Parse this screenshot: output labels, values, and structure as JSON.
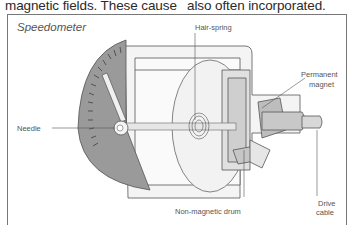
{
  "body_text": {
    "left_column": "magnetic fields. These cause",
    "right_column": "also often incorporated."
  },
  "figure": {
    "title": "Speedometer",
    "labels": {
      "hair_spring": "Hair-spring",
      "permanent_magnet_line1": "Permanent",
      "permanent_magnet_line2": "magnet",
      "needle": "Needle",
      "non_magnetic_drum": "Non-magnetic drum",
      "drive_cable_line1": "Drive",
      "drive_cable_line2": "cable"
    },
    "colors": {
      "dial_face": "#9a9a9a",
      "outline": "#555555",
      "housing": "#eeeeee",
      "magnet": "#bdbdbd"
    }
  }
}
